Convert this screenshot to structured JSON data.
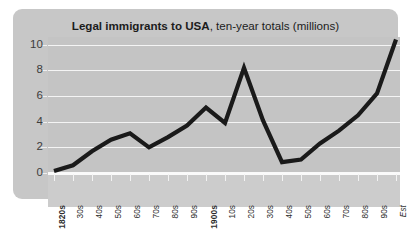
{
  "figure": {
    "panel_color": "#c7c7c7",
    "plot_color": "#c4c4c4",
    "xband_color": "#cccccc",
    "gridline_color": "#f4f4f4",
    "line_color": "#1a1a1a"
  },
  "title": {
    "strong": "Legal immigrants to USA",
    "light": ", ten-year totals (millions)"
  },
  "chart_data": {
    "type": "line",
    "title": "Legal immigrants to USA, ten-year totals (millions)",
    "xlabel": "",
    "ylabel": "",
    "ylim": [
      0,
      10.6
    ],
    "yticks": [
      0,
      2,
      4,
      6,
      8,
      10
    ],
    "ytick_labels": [
      "0",
      "2",
      "4",
      "6",
      "8",
      "10"
    ],
    "grid": true,
    "legend": false,
    "units": "millions",
    "categories": [
      "1820s",
      "30s",
      "40s",
      "50s",
      "60s",
      "70s",
      "80s",
      "90s",
      "1900s",
      "10s",
      "20s",
      "30s",
      "40s",
      "50s",
      "60s",
      "70s",
      "80s",
      "90s",
      "Est"
    ],
    "category_styles": [
      "bold",
      "normal",
      "normal",
      "normal",
      "normal",
      "normal",
      "normal",
      "normal",
      "bold",
      "normal",
      "normal",
      "normal",
      "normal",
      "normal",
      "normal",
      "normal",
      "normal",
      "normal",
      "italic"
    ],
    "values": [
      0.15,
      0.6,
      1.7,
      2.6,
      3.1,
      2.0,
      2.8,
      3.7,
      5.1,
      3.9,
      8.2,
      4.1,
      0.85,
      1.05,
      2.3,
      3.3,
      4.5,
      6.2,
      10.4
    ],
    "series": [
      {
        "name": "Legal immigrants to USA",
        "values": [
          0.15,
          0.6,
          1.7,
          2.6,
          3.1,
          2.0,
          2.8,
          3.7,
          5.1,
          3.9,
          8.2,
          4.1,
          0.85,
          1.05,
          2.3,
          3.3,
          4.5,
          6.2,
          10.4
        ]
      }
    ]
  }
}
